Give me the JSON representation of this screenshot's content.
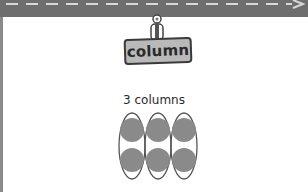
{
  "header": {
    "road_color": "#6e6e6e",
    "dash_color": "#d8d8d8",
    "arrow_icon": "arrow-right"
  },
  "sign": {
    "label": "column",
    "background": "#b9b9b9"
  },
  "illustration": {
    "caption": "3 columns",
    "columns": 3,
    "rows": 2,
    "dot_color": "#8a8a8a",
    "outline_color": "#555555"
  }
}
